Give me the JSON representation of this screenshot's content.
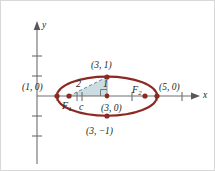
{
  "figure": {
    "type": "geometry-diagram",
    "width": 215,
    "height": 171,
    "background_color": "#ffffff",
    "curve_color": "#8c2a22",
    "point_color": "#8c2a22",
    "axis_color": "#58585b",
    "triangle_fill": "#bcd3d8",
    "dashed_color": "#6c7f93",
    "text_color": "#231f20"
  },
  "axes": {
    "x_label": "x",
    "y_label": "y",
    "x_axis_y_px": 95,
    "y_axis_x_px": 36,
    "unit_px_x": 25,
    "unit_px_y": 20,
    "x_ticks_px": [
      56,
      81,
      131,
      156,
      181
    ],
    "y_ticks_px": [
      55,
      75,
      115,
      135
    ],
    "grid": false
  },
  "ellipse": {
    "center": [
      3,
      0
    ],
    "center_px": [
      106,
      95
    ],
    "semi_major_a": 2,
    "semi_minor_b": 1,
    "semi_major_px": 50,
    "semi_minor_px": 19.5,
    "equation_focal_distance_c": 1.732
  },
  "points": [
    {
      "id": "vertex-left",
      "label": "(1, 0)",
      "x_px": 56,
      "y_px": 95,
      "label_x_px": 22,
      "label_y_px": 83,
      "marker": true
    },
    {
      "id": "vertex-right",
      "label": "(5, 0)",
      "x_px": 156,
      "y_px": 95,
      "label_x_px": 159,
      "label_y_px": 83,
      "marker": true
    },
    {
      "id": "co-vertex-top",
      "label": "(3, 1)",
      "x_px": 106,
      "y_px": 76,
      "label_x_px": 91,
      "label_y_px": 61,
      "marker": true
    },
    {
      "id": "co-vertex-bot",
      "label": "(3, −1)",
      "x_px": 106,
      "y_px": 115,
      "label_x_px": 86,
      "label_y_px": 127,
      "marker": true
    },
    {
      "id": "center",
      "label": "(3, 0)",
      "x_px": 106,
      "y_px": 95,
      "label_x_px": 101,
      "label_y_px": 104,
      "marker": true
    }
  ],
  "foci": [
    {
      "id": "focus-1",
      "label": "F",
      "sub": "1",
      "x_px": 68,
      "y_px": 95,
      "label_x_px": 62,
      "label_y_px": 101
    },
    {
      "id": "focus-2",
      "label": "F",
      "sub": "2",
      "x_px": 144,
      "y_px": 95,
      "label_x_px": 132,
      "label_y_px": 85
    }
  ],
  "triangle": {
    "vertices_px": [
      [
        68,
        95
      ],
      [
        106,
        95
      ],
      [
        106,
        76
      ]
    ],
    "legs": [
      {
        "id": "hypotenuse",
        "label": "2",
        "label_x_px": 76,
        "label_y_px": 79,
        "style": "dashed"
      },
      {
        "id": "vertical-leg",
        "label": "1",
        "label_x_px": 103,
        "label_y_px": 79,
        "style": "solid"
      },
      {
        "id": "base-leg",
        "label": "c",
        "label_x_px": 79,
        "label_y_px": 102,
        "style": "tick"
      }
    ],
    "right_angle_marker": true
  }
}
